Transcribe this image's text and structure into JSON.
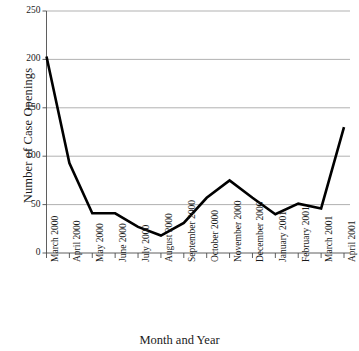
{
  "chart_data": {
    "type": "line",
    "title": "",
    "xlabel": "Month and Year",
    "ylabel": "Number of Case Openings",
    "categories": [
      "March 2000",
      "April 2000",
      "May 2000",
      "June 2000",
      "July 2000",
      "August 2000",
      "September 2000",
      "October 2000",
      "November 2000",
      "December 2000",
      "January 2001",
      "February 2001",
      "March 2001",
      "April 2001"
    ],
    "values": [
      203,
      93,
      41,
      41,
      27,
      18,
      31,
      57,
      75,
      57,
      40,
      51,
      46,
      130
    ],
    "ylim": [
      0,
      250
    ],
    "yticks": [
      0,
      50,
      100,
      150,
      200,
      250
    ],
    "ytick_labels": [
      "0",
      "50",
      "100",
      "150",
      "200",
      "250"
    ],
    "grid": true,
    "grid_axis": "y",
    "legend": "none",
    "series": [
      {
        "name": "Case Openings",
        "color": "#000000",
        "values": [
          203,
          93,
          41,
          41,
          27,
          18,
          31,
          57,
          75,
          57,
          40,
          51,
          46,
          130
        ]
      }
    ]
  },
  "axes": {
    "y_title": "Number of Case Openings",
    "x_title": "Month and Year",
    "y_tick_labels": [
      "250",
      "200",
      "150",
      "100",
      "50",
      "0"
    ],
    "x_tick_labels": [
      "March 2000",
      "April 2000",
      "May 2000",
      "June 2000",
      "July 2000",
      "August 2000",
      "September 2000",
      "October 2000",
      "November 2000",
      "December 2000",
      "January 2001",
      "February 2001",
      "March 2001",
      "April 2001"
    ]
  },
  "colors": {
    "line": "#000000",
    "grid": "#a8a8a8",
    "axis": "#4d4d4d",
    "text": "#1a1a1a",
    "background": "#ffffff"
  },
  "cropped_title": ""
}
